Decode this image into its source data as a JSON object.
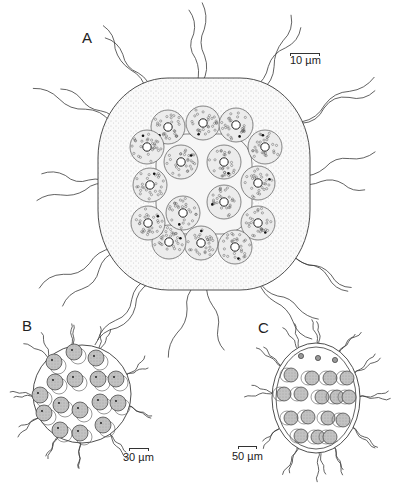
{
  "figure": {
    "panels": [
      {
        "id": "A",
        "label": "A",
        "label_pos": [
          82,
          30
        ],
        "scale_text": "10 µm",
        "scale_text_pos": [
          290,
          55
        ],
        "scale_bar": [
          290,
          53,
          30
        ],
        "envelope": {
          "type": "rounded",
          "x": 98,
          "y": 78,
          "w": 212,
          "h": 212
        },
        "cell_radius": 17,
        "outer_cells": [
          [
            168,
            127
          ],
          [
            203,
            123
          ],
          [
            236,
            125
          ],
          [
            265,
            147
          ],
          [
            258,
            183
          ],
          [
            258,
            223
          ],
          [
            235,
            247
          ],
          [
            201,
            243
          ],
          [
            169,
            242
          ],
          [
            148,
            223
          ],
          [
            150,
            185
          ],
          [
            147,
            147
          ]
        ],
        "inner_cells": [
          [
            181,
            162
          ],
          [
            224,
            162
          ],
          [
            224,
            202
          ],
          [
            183,
            213
          ]
        ]
      },
      {
        "id": "B",
        "label": "B",
        "label_pos": [
          22,
          318
        ],
        "scale_text": "30 µm",
        "scale_text_pos": [
          123,
          452
        ],
        "scale_bar": [
          129,
          448,
          20
        ],
        "envelope": {
          "type": "circle",
          "cx": 82,
          "cy": 394,
          "r": 49
        },
        "cell_radius": 8,
        "cells": [
          [
            74,
            352
          ],
          [
            96,
            358
          ],
          [
            54,
            362
          ],
          [
            55,
            382
          ],
          [
            75,
            379
          ],
          [
            98,
            379
          ],
          [
            116,
            379
          ],
          [
            40,
            395
          ],
          [
            61,
            405
          ],
          [
            80,
            410
          ],
          [
            100,
            402
          ],
          [
            118,
            403
          ],
          [
            44,
            413
          ],
          [
            60,
            430
          ],
          [
            80,
            433
          ],
          [
            103,
            425
          ]
        ]
      },
      {
        "id": "C",
        "label": "C",
        "label_pos": [
          258,
          320
        ],
        "scale_text": "50 µm",
        "scale_text_pos": [
          232,
          451
        ],
        "scale_bar": [
          238,
          446,
          19
        ],
        "envelope": {
          "type": "ellipse",
          "cx": 316,
          "cy": 398,
          "rx": 44,
          "ry": 55
        },
        "cell_radius": 7,
        "small_cells": [
          [
            301,
            356
          ],
          [
            318,
            358
          ],
          [
            335,
            360
          ]
        ],
        "cells": [
          [
            291,
            375
          ],
          [
            312,
            378
          ],
          [
            330,
            378
          ],
          [
            347,
            378
          ],
          [
            284,
            394
          ],
          [
            301,
            394
          ],
          [
            322,
            397
          ],
          [
            337,
            397
          ],
          [
            349,
            397
          ],
          [
            291,
            418
          ],
          [
            308,
            417
          ],
          [
            328,
            418
          ],
          [
            343,
            420
          ],
          [
            301,
            436
          ],
          [
            318,
            437
          ],
          [
            330,
            437
          ]
        ]
      }
    ],
    "colors": {
      "line": "#3a3a3a",
      "stipple": "#9a9a9a",
      "cell_fill_A": "#ececec",
      "cell_fill_BC": "#bdbdbd",
      "background": "#ffffff"
    }
  }
}
